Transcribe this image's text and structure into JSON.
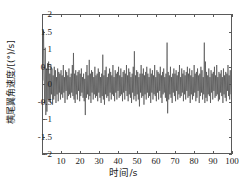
{
  "chart_data": {
    "type": "line",
    "title": "",
    "xlabel": "时间/s",
    "ylabel": "横尾翼角速度/[(°)/s]",
    "xlim": [
      0,
      100
    ],
    "ylim": [
      -2,
      2
    ],
    "xticks": [
      10,
      20,
      30,
      40,
      50,
      60,
      70,
      80,
      90,
      100
    ],
    "xtick_labels": [
      "10",
      "20",
      "30",
      "40",
      "50",
      "60",
      "70",
      "80",
      "90",
      "100"
    ],
    "yticks": [
      -2,
      -1.5,
      -1,
      -0.5,
      0,
      0.5,
      1,
      1.5,
      2
    ],
    "ytick_labels": [
      "-2",
      "-1.5",
      "-1",
      "-0.5",
      "0",
      "0.5",
      "1",
      "1.5",
      "2"
    ],
    "grid": false,
    "legend": null,
    "line_color": "#3c3c3c",
    "line_width": 0.6,
    "box_color": "#5a5a5a",
    "series": [
      {
        "name": "横尾翼角速度",
        "x": [
          0.0,
          0.3,
          0.6,
          0.9,
          1.2,
          1.5,
          1.8,
          2.1,
          2.4,
          2.7,
          3.0,
          3.3,
          3.6,
          3.9,
          4.2,
          4.5,
          4.8,
          5.1,
          5.4,
          5.7,
          6.0,
          6.3,
          6.6,
          6.9,
          7.2,
          7.5,
          7.8,
          8.1,
          8.4,
          8.7,
          9.0,
          9.3,
          9.6,
          9.9,
          10.2,
          10.5,
          10.8,
          11.1,
          11.4,
          11.7,
          12.0,
          12.3,
          12.6,
          12.9,
          13.2,
          13.5,
          13.8,
          14.1,
          14.4,
          14.7,
          15.0,
          15.3,
          15.6,
          15.9,
          16.2,
          16.5,
          16.8,
          17.1,
          17.4,
          17.7,
          18.0,
          18.3,
          18.6,
          18.9,
          19.2,
          19.5,
          19.8,
          20.1,
          20.4,
          20.7,
          21.0,
          21.3,
          21.6,
          21.9,
          22.2,
          22.5,
          22.8,
          23.1,
          23.4,
          23.7,
          24.0,
          24.3,
          24.6,
          24.9,
          25.2,
          25.5,
          25.8,
          26.1,
          26.4,
          26.7,
          27.0,
          27.3,
          27.6,
          27.9,
          28.2,
          28.5,
          28.8,
          29.1,
          29.4,
          29.7,
          30.0,
          30.3,
          30.6,
          30.9,
          31.2,
          31.5,
          31.8,
          32.1,
          32.4,
          32.7,
          33.0,
          33.3,
          33.6,
          33.9,
          34.2,
          34.5,
          34.8,
          35.1,
          35.4,
          35.7,
          36.0,
          36.3,
          36.6,
          36.9,
          37.2,
          37.5,
          37.8,
          38.1,
          38.4,
          38.7,
          39.0,
          39.3,
          39.6,
          39.9,
          40.2,
          40.5,
          40.8,
          41.1,
          41.4,
          41.7,
          42.0,
          42.3,
          42.6,
          42.9,
          43.2,
          43.5,
          43.8,
          44.1,
          44.4,
          44.7,
          45.0,
          45.3,
          45.6,
          45.9,
          46.2,
          46.5,
          46.8,
          47.1,
          47.4,
          47.7,
          48.0,
          48.3,
          48.6,
          48.9,
          49.2,
          49.5,
          49.8,
          50.1,
          50.4,
          50.7,
          51.0,
          51.3,
          51.6,
          51.9,
          52.2,
          52.5,
          52.8,
          53.1,
          53.4,
          53.7,
          54.0,
          54.3,
          54.6,
          54.9,
          55.2,
          55.5,
          55.8,
          56.1,
          56.4,
          56.7,
          57.0,
          57.3,
          57.6,
          57.9,
          58.2,
          58.5,
          58.8,
          59.1,
          59.4,
          59.7,
          60.0,
          60.3,
          60.6,
          60.9,
          61.2,
          61.5,
          61.8,
          62.1,
          62.4,
          62.7,
          63.0,
          63.3,
          63.6,
          63.9,
          64.2,
          64.5,
          64.8,
          65.1,
          65.4,
          65.7,
          66.0,
          66.3,
          66.6,
          66.9,
          67.2,
          67.5,
          67.8,
          68.1,
          68.4,
          68.7,
          69.0,
          69.3,
          69.6,
          69.9,
          70.2,
          70.5,
          70.8,
          71.1,
          71.4,
          71.7,
          72.0,
          72.3,
          72.6,
          72.9,
          73.2,
          73.5,
          73.8,
          74.1,
          74.4,
          74.7,
          75.0,
          75.3,
          75.6,
          75.9,
          76.2,
          76.5,
          76.8,
          77.1,
          77.4,
          77.7,
          78.0,
          78.3,
          78.6,
          78.9,
          79.2,
          79.5,
          79.8,
          80.1,
          80.4,
          80.7,
          81.0,
          81.3,
          81.6,
          81.9,
          82.2,
          82.5,
          82.8,
          83.1,
          83.4,
          83.7,
          84.0,
          84.3,
          84.6,
          84.9,
          85.2,
          85.5,
          85.8,
          86.1,
          86.4,
          86.7,
          87.0,
          87.3,
          87.6,
          87.9,
          88.2,
          88.5,
          88.8,
          89.1,
          89.4,
          89.7,
          90.0,
          90.3,
          90.6,
          90.9,
          91.2,
          91.5,
          91.8,
          92.1,
          92.4,
          92.7,
          93.0,
          93.3,
          93.6,
          93.9,
          94.2,
          94.5,
          94.8,
          95.1,
          95.4,
          95.7,
          96.0,
          96.3,
          96.6,
          96.9,
          97.2,
          97.5,
          97.8,
          98.1,
          98.4,
          98.7,
          99.0,
          99.3,
          99.6,
          99.9
        ],
        "y": [
          0.1,
          1.55,
          0.35,
          -0.55,
          1.05,
          -0.9,
          0.45,
          -0.8,
          0.6,
          -0.45,
          0.65,
          -0.5,
          0.3,
          -0.55,
          0.55,
          -0.3,
          0.45,
          -0.6,
          0.25,
          -0.45,
          0.5,
          -0.35,
          0.4,
          -0.55,
          0.2,
          -0.3,
          0.45,
          -0.5,
          0.35,
          -0.25,
          0.3,
          -0.45,
          0.4,
          -0.3,
          0.25,
          -0.4,
          0.55,
          -0.25,
          0.2,
          -0.55,
          0.4,
          -0.2,
          0.35,
          -0.45,
          0.25,
          -0.35,
          0.45,
          -0.3,
          0.2,
          -0.4,
          0.3,
          -0.25,
          0.55,
          -0.35,
          0.9,
          -0.45,
          0.3,
          -0.55,
          0.4,
          -0.3,
          0.25,
          -0.45,
          0.35,
          -0.2,
          0.4,
          -0.5,
          0.3,
          -0.35,
          0.45,
          -0.25,
          0.2,
          -0.4,
          0.3,
          -0.5,
          0.15,
          -0.9,
          0.35,
          -0.4,
          0.55,
          -0.3,
          0.25,
          -0.45,
          0.7,
          -0.35,
          0.3,
          -0.55,
          0.4,
          -0.25,
          0.35,
          -0.45,
          0.2,
          -0.3,
          0.5,
          -0.4,
          0.25,
          -0.35,
          0.3,
          -0.5,
          0.45,
          -0.25,
          0.35,
          -0.4,
          0.2,
          -0.55,
          0.3,
          -0.35,
          0.85,
          -0.45,
          0.25,
          -0.6,
          0.4,
          -0.3,
          0.5,
          -0.4,
          0.2,
          -0.35,
          0.3,
          -0.5,
          0.45,
          -0.25,
          0.35,
          -0.45,
          0.25,
          -0.3,
          0.55,
          -0.35,
          0.2,
          -0.5,
          0.4,
          -0.25,
          0.3,
          -0.45,
          0.35,
          -0.2,
          0.5,
          -0.4,
          0.25,
          -0.35,
          0.45,
          -0.3,
          0.2,
          -0.5,
          0.35,
          -0.25,
          0.4,
          -0.45,
          0.3,
          -0.2,
          0.55,
          -0.35,
          0.25,
          -0.5,
          0.45,
          -0.3,
          0.35,
          -0.4,
          0.2,
          -0.55,
          0.3,
          -0.25,
          0.5,
          -0.45,
          0.95,
          -0.35,
          0.25,
          -0.5,
          0.4,
          -0.3,
          0.35,
          -0.45,
          0.2,
          -0.65,
          0.3,
          -0.25,
          0.55,
          -0.4,
          0.3,
          -0.35,
          0.45,
          -0.6,
          0.25,
          -0.3,
          0.35,
          -0.45,
          0.5,
          -0.25,
          0.3,
          -0.4,
          0.2,
          -0.35,
          0.45,
          -0.55,
          0.3,
          -0.25,
          0.4,
          -0.45,
          0.25,
          -0.3,
          0.55,
          -0.35,
          0.2,
          -0.5,
          0.4,
          -0.25,
          0.35,
          -0.45,
          0.3,
          -0.2,
          0.5,
          -0.4,
          0.25,
          -0.55,
          0.35,
          -0.3,
          0.45,
          -0.25,
          0.2,
          -0.4,
          0.3,
          -0.5,
          1.2,
          -0.85,
          0.35,
          -0.45,
          0.25,
          -0.3,
          0.5,
          -0.4,
          0.2,
          -0.55,
          0.3,
          -0.25,
          0.45,
          -0.35,
          0.3,
          -0.5,
          0.4,
          -0.2,
          0.25,
          -0.45,
          0.35,
          -0.3,
          0.55,
          -0.4,
          0.2,
          -0.35,
          0.45,
          -0.25,
          0.3,
          -0.5,
          0.4,
          -0.3,
          0.25,
          -0.45,
          0.35,
          -0.2,
          0.5,
          -0.4,
          0.3,
          -0.35,
          0.45,
          -0.55,
          0.25,
          -0.3,
          0.4,
          -0.45,
          0.2,
          -0.35,
          0.55,
          -0.25,
          0.3,
          -0.5,
          0.35,
          -0.4,
          0.45,
          -0.2,
          0.25,
          -0.55,
          0.3,
          -0.35,
          0.5,
          -0.25,
          0.4,
          -0.45,
          0.2,
          -0.3,
          1.2,
          -0.55,
          0.65,
          -0.4,
          0.35,
          -0.5,
          0.25,
          -0.3,
          0.45,
          -0.35,
          0.2,
          -0.55,
          0.4,
          -0.25,
          0.3,
          -0.45,
          0.35,
          -0.2,
          0.5,
          -0.4,
          0.25,
          -0.35,
          0.55,
          -0.3,
          0.2,
          -0.5,
          0.35,
          -0.45,
          0.3,
          -0.25,
          0.4,
          -0.35,
          0.2,
          -0.55,
          0.45,
          -0.3,
          0.25,
          -0.4,
          0.35,
          -0.5,
          0.3,
          -0.2,
          0.55,
          -0.35,
          0.25,
          -0.45,
          0.4,
          -0.3
        ]
      }
    ]
  }
}
